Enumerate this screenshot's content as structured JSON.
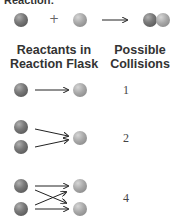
{
  "title_partial": "Reaction:",
  "equation": {
    "plus": "+"
  },
  "headers": {
    "reactants": [
      "Reactants in",
      "Reaction Flask"
    ],
    "collisions": [
      "Possible",
      "Collisions"
    ]
  },
  "rows": [
    {
      "dark_count": 1,
      "light_count": 1,
      "collisions": "1"
    },
    {
      "dark_count": 2,
      "light_count": 1,
      "collisions": "2"
    },
    {
      "dark_count": 2,
      "light_count": 2,
      "collisions": "4"
    }
  ],
  "colors": {
    "dark_sphere": "#5e5e5e",
    "light_sphere": "#a0a0a0",
    "text": "#333333"
  }
}
